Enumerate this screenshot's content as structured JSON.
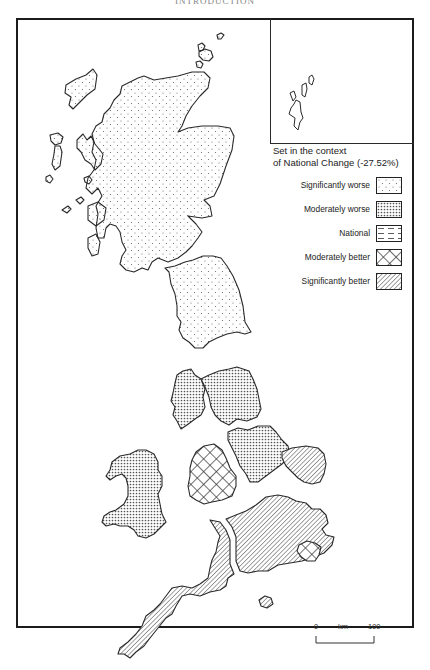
{
  "page": {
    "header_text": "INTRODUCTION"
  },
  "map": {
    "title": "Regional change map of Great Britain",
    "inset_label": "Shetland Islands inset",
    "regions": [
      {
        "name": "Scotland",
        "category": "Significantly worse"
      },
      {
        "name": "North",
        "category": "Significantly worse"
      },
      {
        "name": "North West",
        "category": "Moderately worse"
      },
      {
        "name": "Yorkshire and Humberside",
        "category": "Moderately worse"
      },
      {
        "name": "Wales",
        "category": "Moderately worse"
      },
      {
        "name": "West Midlands",
        "category": "Moderately better"
      },
      {
        "name": "East Midlands",
        "category": "Moderately worse"
      },
      {
        "name": "East Anglia",
        "category": "Significantly better"
      },
      {
        "name": "South West",
        "category": "Significantly better"
      },
      {
        "name": "South East",
        "category": "Significantly better"
      },
      {
        "name": "Greater London",
        "category": "Moderately better"
      }
    ]
  },
  "legend": {
    "title_line1": "Set in the context",
    "title_line2": "of National Change (-27.52%)",
    "national_change": "-27.52%",
    "items": [
      {
        "label": "Significantly worse",
        "pattern": "sparse-dots"
      },
      {
        "label": "Moderately worse",
        "pattern": "dense-dots"
      },
      {
        "label": "National",
        "pattern": "dashes"
      },
      {
        "label": "Moderately better",
        "pattern": "crosshatch"
      },
      {
        "label": "Significantly better",
        "pattern": "diagonal-lines"
      }
    ]
  },
  "scale": {
    "start": "0",
    "unit": "km",
    "end": "100"
  },
  "colors": {
    "outline": "#2a2a2a",
    "fill_background": "#ffffff",
    "pattern_ink": "#555555"
  }
}
